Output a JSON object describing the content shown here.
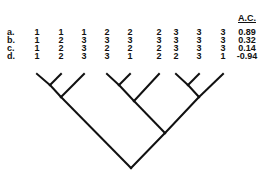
{
  "header": {
    "ac_label": "A.C."
  },
  "rows": [
    {
      "label": "a.",
      "values": [
        "1",
        "1",
        "1",
        "2",
        "2",
        "2",
        "3",
        "3",
        "3"
      ],
      "ac": "0.89"
    },
    {
      "label": "b.",
      "values": [
        "1",
        "2",
        "3",
        "3",
        "3",
        "3",
        "3",
        "3",
        "3"
      ],
      "ac": "0.32"
    },
    {
      "label": "c.",
      "values": [
        "1",
        "2",
        "3",
        "2",
        "2",
        "2",
        "3",
        "3",
        "3"
      ],
      "ac": "0.14"
    },
    {
      "label": "d.",
      "values": [
        "1",
        "2",
        "3",
        "3",
        "1",
        "2",
        "2",
        "3",
        "1"
      ],
      "ac": "-0.94"
    }
  ],
  "tree": {
    "tips_x": [
      37,
      61,
      84,
      107,
      130,
      159,
      176,
      199,
      223
    ],
    "tip_y": 74,
    "edges": [
      [
        37,
        74,
        50,
        85
      ],
      [
        61,
        74,
        50,
        85
      ],
      [
        50,
        85,
        61,
        97
      ],
      [
        84,
        74,
        61,
        97
      ],
      [
        61,
        97,
        131,
        168
      ],
      [
        107,
        74,
        119,
        85
      ],
      [
        130,
        74,
        119,
        85
      ],
      [
        119,
        85,
        134,
        101
      ],
      [
        159,
        74,
        134,
        101
      ],
      [
        134,
        101,
        165,
        133
      ],
      [
        176,
        74,
        188,
        85
      ],
      [
        199,
        74,
        188,
        85
      ],
      [
        188,
        85,
        199,
        97
      ],
      [
        223,
        74,
        199,
        97
      ],
      [
        199,
        97,
        165,
        133
      ],
      [
        165,
        133,
        131,
        168
      ]
    ],
    "stroke_color": "#111111"
  }
}
